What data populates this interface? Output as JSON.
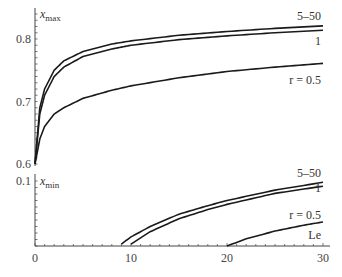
{
  "chart_data": [
    {
      "type": "line",
      "title": "",
      "xlabel": "",
      "ylabel": "x_max",
      "ylabel_main": "x",
      "ylabel_sub": "max",
      "xlim": [
        0,
        30
      ],
      "ylim": [
        0.6,
        0.84
      ],
      "y_ticks": [
        "0.8",
        "0.7",
        "0.6"
      ],
      "grid": false,
      "legend": "inline labels at right end",
      "series": [
        {
          "name": "5–50",
          "label": "5–50",
          "x": [
            0,
            0.5,
            1,
            2,
            3,
            5,
            8,
            10,
            15,
            20,
            25,
            30
          ],
          "y": [
            0.6,
            0.69,
            0.72,
            0.75,
            0.765,
            0.78,
            0.792,
            0.797,
            0.806,
            0.812,
            0.817,
            0.821
          ]
        },
        {
          "name": "1",
          "label": "1",
          "x": [
            0,
            0.5,
            1,
            2,
            3,
            5,
            8,
            10,
            15,
            20,
            25,
            30
          ],
          "y": [
            0.6,
            0.68,
            0.71,
            0.74,
            0.755,
            0.772,
            0.784,
            0.79,
            0.799,
            0.805,
            0.81,
            0.814
          ]
        },
        {
          "name": "r = 0.5",
          "label": "r = 0.5",
          "x": [
            0,
            0.5,
            1,
            2,
            3,
            5,
            8,
            10,
            15,
            20,
            25,
            30
          ],
          "y": [
            0.6,
            0.64,
            0.66,
            0.68,
            0.69,
            0.705,
            0.718,
            0.725,
            0.738,
            0.748,
            0.755,
            0.761
          ]
        }
      ]
    },
    {
      "type": "line",
      "title": "",
      "xlabel": "Le",
      "ylabel": "x_min",
      "ylabel_main": "x",
      "ylabel_sub": "min",
      "xlim": [
        0,
        30
      ],
      "ylim": [
        0,
        0.1
      ],
      "x_ticks": [
        "0",
        "10",
        "20",
        "30"
      ],
      "y_ticks": [
        "0.1"
      ],
      "grid": false,
      "legend": "inline labels at right end",
      "series": [
        {
          "name": "5–50",
          "label": "5–50",
          "x": [
            9,
            10,
            12,
            15,
            18,
            20,
            25,
            30
          ],
          "y": [
            0.003,
            0.014,
            0.03,
            0.049,
            0.062,
            0.07,
            0.086,
            0.098
          ]
        },
        {
          "name": "1",
          "label": "1",
          "x": [
            10,
            12,
            15,
            18,
            20,
            25,
            30
          ],
          "y": [
            0.003,
            0.022,
            0.042,
            0.056,
            0.064,
            0.081,
            0.092
          ]
        },
        {
          "name": "r = 0.5",
          "label": "r = 0.5",
          "x": [
            20,
            22,
            25,
            28,
            30
          ],
          "y": [
            0.0,
            0.011,
            0.023,
            0.032,
            0.037
          ]
        }
      ]
    }
  ]
}
